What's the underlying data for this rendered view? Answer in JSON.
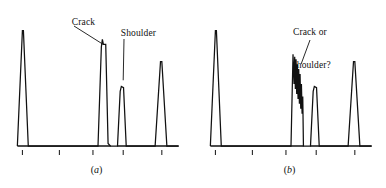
{
  "figure": {
    "background": "#ffffff",
    "ink_color": "#111111",
    "panels": [
      {
        "id": "a",
        "caption": "a",
        "annotations": [
          {
            "name": "crack",
            "text": "Crack",
            "lines": [
              "Crack"
            ]
          },
          {
            "name": "shoulder",
            "text": "Shoulder",
            "lines": [
              "Shoulder"
            ]
          }
        ]
      },
      {
        "id": "b",
        "caption": "b",
        "annotations": [
          {
            "name": "crack-or-shoulder",
            "text": "Crack or shoulder?",
            "lines": [
              "Crack or",
              "shoulder?"
            ]
          }
        ]
      }
    ]
  },
  "chart_data": [
    {
      "type": "line",
      "title": "(a)",
      "xlabel": "",
      "ylabel": "",
      "grid": false,
      "legend": null,
      "xlim": [
        0,
        100
      ],
      "ylim": [
        0,
        100
      ],
      "axis": {
        "baseline_y": 0,
        "ticks": [
          5,
          27,
          47,
          65,
          88
        ],
        "tick_labels": [
          "",
          "",
          "",
          "",
          ""
        ],
        "baseline_gaps": [
          [
            57.5,
            61.5
          ]
        ]
      },
      "annotations": [
        {
          "text": "Crack",
          "points_to_x": 53,
          "points_to_y": 82
        },
        {
          "text": "Shoulder",
          "points_to_x": 65,
          "points_to_y": 53
        }
      ],
      "series": [
        {
          "name": "trace-a",
          "description": "Four-peak trace: tall peak, very tall crack peak with upper shoulder notch, short shoulder peak, medium peak",
          "x": [
            2.0,
            5.0,
            5.6,
            8.5,
            50.0,
            52.0,
            52.6,
            53.2,
            54.6,
            56.0,
            57.4,
            61.6,
            63.2,
            63.9,
            65.2,
            66.8,
            84.0,
            87.2,
            88.0,
            91.0,
            98.0
          ],
          "y": [
            0.0,
            93.0,
            93.0,
            0.0,
            0.0,
            80.0,
            86.0,
            82.0,
            82.0,
            2.0,
            0.0,
            0.0,
            44.0,
            48.0,
            47.0,
            0.0,
            0.0,
            68.0,
            68.0,
            0.0,
            0.0
          ]
        }
      ]
    },
    {
      "type": "line",
      "title": "(b)",
      "xlabel": "",
      "ylabel": "",
      "grid": false,
      "legend": null,
      "xlim": [
        0,
        100
      ],
      "ylim": [
        0,
        100
      ],
      "axis": {
        "baseline_y": 0,
        "ticks": [
          5,
          27,
          47,
          65,
          88
        ],
        "tick_labels": [
          "",
          "",
          "",
          "",
          ""
        ],
        "baseline_gaps": [
          [
            57.5,
            61.5
          ]
        ]
      },
      "annotations": [
        {
          "text": "Crack or shoulder?",
          "points_to_x": 56,
          "points_to_y": 66
        }
      ],
      "series": [
        {
          "name": "trace-b",
          "description": "Tall left peak, a jagged noisy multi-spike cluster in the middle, medium right peak",
          "x": [
            2.0,
            5.0,
            5.6,
            8.5,
            50.0,
            51.2,
            51.8,
            52.2,
            52.6,
            53.0,
            53.4,
            53.8,
            54.2,
            54.6,
            55.0,
            55.4,
            55.8,
            56.2,
            56.6,
            57.0,
            57.4,
            61.6,
            63.2,
            63.9,
            65.2,
            66.8,
            84.0,
            87.2,
            88.0,
            91.0,
            98.0
          ],
          "y": [
            0.0,
            93.0,
            93.0,
            0.0,
            0.0,
            74.0,
            50.0,
            72.0,
            46.0,
            70.0,
            42.0,
            66.0,
            38.0,
            62.0,
            34.0,
            58.0,
            30.0,
            50.0,
            26.0,
            40.0,
            0.0,
            0.0,
            44.0,
            48.0,
            47.0,
            0.0,
            0.0,
            68.0,
            68.0,
            0.0,
            0.0
          ]
        }
      ]
    }
  ]
}
